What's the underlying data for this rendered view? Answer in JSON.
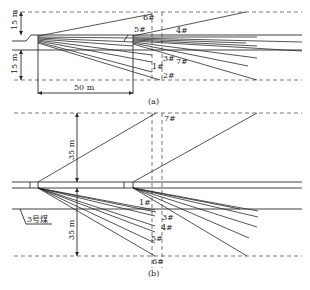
{
  "panel_a": {
    "caption": "(a)",
    "dims": {
      "upper": "15 m",
      "lower": "15 m",
      "width": "50 m"
    },
    "boreholes": [
      "1#",
      "2#",
      "3#",
      "4#",
      "5#",
      "6#",
      "7#"
    ]
  },
  "panel_b": {
    "caption": "(b)",
    "dims": {
      "upper": "35 m",
      "lower": "35 m"
    },
    "seam_label": "3号煤",
    "boreholes": [
      "1#",
      "3#",
      "4#",
      "5#",
      "6#",
      "7#"
    ]
  },
  "colors": {
    "line": "#2a2a2a",
    "dash": "#555555",
    "background": "#ffffff"
  }
}
